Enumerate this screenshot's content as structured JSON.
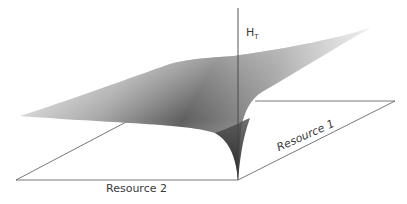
{
  "figure": {
    "type": "3d-surface-diagram",
    "z_axis_label": "H",
    "z_axis_label_subscript": "T",
    "x_axis_label": "Resource 2",
    "y_axis_label": "Resource 1",
    "colors": {
      "axis": "#555555",
      "surface_light": "#f2f2f2",
      "surface_mid": "#8a8a8a",
      "surface_dark": "#1e1e1e",
      "text": "#3a3a3a"
    }
  }
}
